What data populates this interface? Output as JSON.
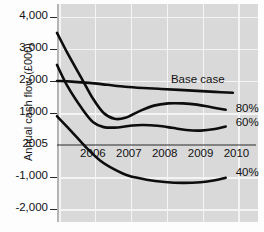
{
  "chart_data": {
    "type": "line",
    "title": "",
    "xlabel": "",
    "ylabel": "Annual cash flow (£000)",
    "grid": true,
    "legend_position": "right-of-series-end",
    "xlim": [
      2005,
      2010.6
    ],
    "ylim": [
      -2400,
      4400
    ],
    "x_ticks": [
      2005,
      2006,
      2007,
      2008,
      2009,
      2010
    ],
    "x_tick_labels": [
      "2005",
      "2006",
      "2007",
      "2008",
      "2009",
      "2010"
    ],
    "y_ticks": [
      4000,
      3000,
      2000,
      1000,
      0,
      -1000,
      -2000
    ],
    "y_tick_labels": [
      "4,000",
      "3,000",
      "2,000",
      "1,000",
      "2005",
      "-1,000",
      "-2,000"
    ],
    "zero_line_label": "2005",
    "series": [
      {
        "name": "Base case",
        "label": "Base case",
        "x": [
          2005.0,
          2005.4,
          2005.9,
          2006.4,
          2006.9,
          2007.4,
          2007.9,
          2008.4,
          2008.9,
          2009.4,
          2009.9
        ],
        "values": [
          2000,
          1980,
          1940,
          1880,
          1820,
          1780,
          1750,
          1720,
          1690,
          1660,
          1630
        ]
      },
      {
        "name": "80%",
        "label": "80%",
        "x": [
          2005.0,
          2005.3,
          2005.7,
          2006.0,
          2006.3,
          2006.6,
          2006.9,
          2007.3,
          2007.7,
          2008.1,
          2008.5,
          2008.9,
          2009.3,
          2009.7
        ],
        "values": [
          3500,
          2850,
          2050,
          1450,
          1000,
          820,
          850,
          1060,
          1230,
          1300,
          1300,
          1260,
          1180,
          1100
        ]
      },
      {
        "name": "60%",
        "label": "60%",
        "x": [
          2005.0,
          2005.3,
          2005.7,
          2006.0,
          2006.3,
          2006.7,
          2007.1,
          2007.4,
          2007.8,
          2008.2,
          2008.6,
          2009.0,
          2009.4,
          2009.7
        ],
        "values": [
          2500,
          1820,
          1130,
          720,
          560,
          550,
          610,
          625,
          600,
          540,
          470,
          450,
          500,
          580
        ]
      },
      {
        "name": "40%",
        "label": "40%",
        "x": [
          2005.0,
          2005.4,
          2005.8,
          2006.2,
          2006.6,
          2007.0,
          2007.5,
          2008.0,
          2008.5,
          2009.0,
          2009.4,
          2009.7
        ],
        "values": [
          900,
          430,
          -60,
          -480,
          -760,
          -960,
          -1080,
          -1150,
          -1180,
          -1160,
          -1100,
          -1020
        ]
      }
    ]
  },
  "axis": {
    "y_title": "Annual cash flow (£000)"
  },
  "colors": {
    "plot_background": "#d9d9d9",
    "gridline": "#f4f4f4",
    "series_line": "#0d0d0d",
    "text": "#111111",
    "page_background": "#fdfdfd"
  }
}
